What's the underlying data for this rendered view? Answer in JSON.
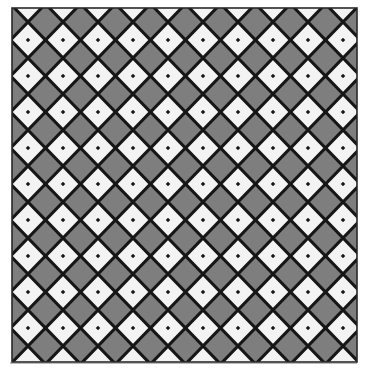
{
  "image": {
    "description": "Diagonal checkerboard tile pattern (diamonds) of alternating light and gray squares with dark grout lines inside a square frame",
    "frame": {
      "x": 12,
      "y": 8,
      "width": 345,
      "height": 354
    },
    "pattern": {
      "tile_width": 35,
      "tile_height": 36,
      "origin_x": 28,
      "origin_y": 4,
      "line_width": 3.2
    },
    "colors": {
      "light_tile": "#f3f3f3",
      "dark_tile": "#7e7e7e",
      "grout": "#161616",
      "frame": "#2a2a2a",
      "background": "#ffffff"
    }
  }
}
